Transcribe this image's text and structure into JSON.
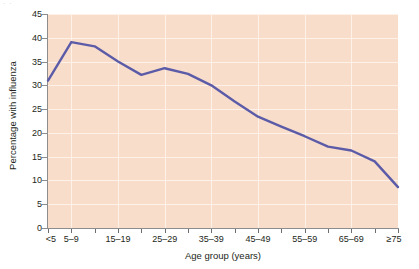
{
  "figure": {
    "corner_mark": "· ·",
    "background_color": "#ffffff"
  },
  "chart_data": {
    "type": "line",
    "title": "",
    "xlabel": "Age group (years)",
    "ylabel": "Percentage with influenza",
    "categories": [
      "<5",
      "5–9",
      "10–14",
      "15–19",
      "20–24",
      "25–29",
      "30–34",
      "35–39",
      "40–44",
      "45–49",
      "50–54",
      "55–59",
      "60–64",
      "65–69",
      "70–74",
      "≥75"
    ],
    "tick_labels_shown": [
      "<5",
      "5–9",
      "",
      "15–19",
      "",
      "25–29",
      "",
      "35–39",
      "",
      "45–49",
      "",
      "55–59",
      "",
      "65–69",
      "",
      "≥75"
    ],
    "values": [
      31.0,
      39.1,
      38.2,
      35.0,
      32.2,
      33.6,
      32.4,
      30.0,
      26.6,
      23.4,
      21.3,
      19.3,
      17.1,
      16.3,
      14.0,
      8.6
    ],
    "ylim": [
      0,
      45
    ],
    "yticks": [
      0,
      5,
      10,
      15,
      20,
      25,
      30,
      35,
      40,
      45
    ],
    "xlim_index": [
      0,
      15
    ],
    "grid": true,
    "legend": "none",
    "series_color": "#5b5ba8",
    "plot_background_color": "#f8ddcb",
    "gridline_color": "#fdf1e8",
    "axis_color": "#8d8d8d"
  }
}
